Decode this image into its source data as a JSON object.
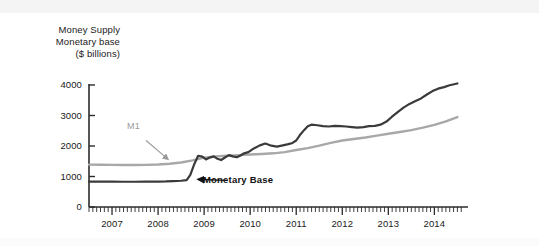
{
  "figure": {
    "title_lines": [
      "Money Supply",
      "Monetary base",
      "($ billions)"
    ],
    "background_color": "#ffffff"
  },
  "annotations": {
    "m1_label": "M1",
    "monetary_base_label": "Monetary Base"
  },
  "colors": {
    "m1_line": "#a8a8a8",
    "monetary_base_line": "#3a3a3a",
    "axis": "#2b2b2b",
    "m1_label_color": "#9a9a9a",
    "mb_label_color": "#111111"
  },
  "axis": {
    "y_ticks": [
      "0",
      "1000",
      "2000",
      "3000",
      "4000"
    ],
    "x_ticks": [
      "2007",
      "2008",
      "2009",
      "2010",
      "2011",
      "2012",
      "2013",
      "2014"
    ]
  },
  "chart_data": {
    "type": "line",
    "title": "Money Supply  Monetary base ($ billions)",
    "xlabel": "",
    "ylabel": "($ billions)",
    "xlim": [
      2006.5,
      2014.6
    ],
    "ylim": [
      0,
      4000
    ],
    "grid": false,
    "legend": "inline-annotations",
    "y_ticks": [
      0,
      1000,
      2000,
      3000,
      4000
    ],
    "x_ticks": [
      2007,
      2008,
      2009,
      2010,
      2011,
      2012,
      2013,
      2014
    ],
    "x_minor_tick_interval": 0.0833,
    "annotations": [
      {
        "text": "M1",
        "x": 2007.7,
        "y": 2270,
        "points_to": {
          "x": 2008.25,
          "y": 1480
        }
      },
      {
        "text": "Monetary Base",
        "x": 2009.6,
        "y": 800,
        "points_to": {
          "x": 2008.85,
          "y": 890
        }
      }
    ],
    "series": [
      {
        "name": "M1",
        "color": "#a8a8a8",
        "x": [
          2006.5,
          2006.75,
          2007.0,
          2007.25,
          2007.5,
          2007.75,
          2008.0,
          2008.25,
          2008.5,
          2008.75,
          2009.0,
          2009.25,
          2009.5,
          2009.75,
          2010.0,
          2010.25,
          2010.5,
          2010.75,
          2011.0,
          2011.25,
          2011.5,
          2011.75,
          2012.0,
          2012.25,
          2012.5,
          2012.75,
          2013.0,
          2013.25,
          2013.5,
          2013.75,
          2014.0,
          2014.25,
          2014.5
        ],
        "values": [
          1390,
          1385,
          1380,
          1375,
          1375,
          1380,
          1395,
          1420,
          1460,
          1530,
          1620,
          1660,
          1680,
          1700,
          1720,
          1740,
          1760,
          1800,
          1870,
          1930,
          2010,
          2100,
          2180,
          2230,
          2280,
          2340,
          2400,
          2460,
          2520,
          2600,
          2690,
          2810,
          2950
        ]
      },
      {
        "name": "Monetary Base",
        "color": "#3a3a3a",
        "x": [
          2006.5,
          2006.75,
          2007.0,
          2007.25,
          2007.5,
          2007.75,
          2008.0,
          2008.17,
          2008.33,
          2008.5,
          2008.62,
          2008.7,
          2008.79,
          2008.87,
          2008.96,
          2009.04,
          2009.12,
          2009.21,
          2009.29,
          2009.37,
          2009.46,
          2009.54,
          2009.62,
          2009.71,
          2009.79,
          2009.87,
          2009.96,
          2010.08,
          2010.21,
          2010.33,
          2010.46,
          2010.58,
          2010.71,
          2010.83,
          2010.92,
          2011.0,
          2011.08,
          2011.17,
          2011.25,
          2011.33,
          2011.46,
          2011.58,
          2011.71,
          2011.83,
          2011.96,
          2012.08,
          2012.21,
          2012.33,
          2012.46,
          2012.58,
          2012.71,
          2012.83,
          2012.96,
          2013.08,
          2013.21,
          2013.33,
          2013.46,
          2013.58,
          2013.71,
          2013.83,
          2013.96,
          2014.08,
          2014.21,
          2014.33,
          2014.5
        ],
        "values": [
          835,
          830,
          830,
          828,
          828,
          830,
          835,
          840,
          850,
          860,
          880,
          1050,
          1420,
          1680,
          1650,
          1560,
          1620,
          1660,
          1580,
          1540,
          1630,
          1700,
          1660,
          1630,
          1690,
          1760,
          1800,
          1920,
          2020,
          2080,
          2010,
          1980,
          2020,
          2060,
          2100,
          2180,
          2360,
          2520,
          2650,
          2700,
          2680,
          2650,
          2640,
          2660,
          2650,
          2640,
          2620,
          2600,
          2620,
          2650,
          2660,
          2700,
          2800,
          2960,
          3120,
          3260,
          3380,
          3470,
          3560,
          3680,
          3800,
          3880,
          3930,
          3990,
          4050
        ]
      }
    ]
  }
}
